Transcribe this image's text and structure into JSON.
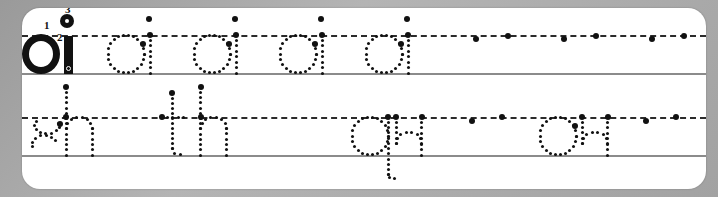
{
  "worksheet": {
    "title": "Handwriting Practice Worksheet",
    "type": "letter-tracing",
    "background_color": "#a8a8a8",
    "card_color": "#ffffff",
    "ink_color": "#111111",
    "baseline_color": "#8b8b8b",
    "midline_color": "#2b2b2b",
    "rows": [
      {
        "id": "row-1",
        "pattern": "oi",
        "model": {
          "text": "oi",
          "style": "solid",
          "stroke_numbers": [
            "1",
            "2",
            "3"
          ]
        },
        "traced": [
          {
            "text": "oi",
            "style": "dotted"
          },
          {
            "text": "oi",
            "style": "dotted"
          },
          {
            "text": "oi",
            "style": "dotted"
          },
          {
            "text": "oi",
            "style": "dotted"
          }
        ],
        "blank_practice_slots": 3
      },
      {
        "id": "row-2",
        "pattern": "sh th qu ou",
        "traced": [
          {
            "text": "sh",
            "style": "dotted"
          },
          {
            "text": "th",
            "style": "dotted"
          },
          {
            "text": "qu",
            "style": "dotted"
          },
          {
            "text": "ou",
            "style": "dotted"
          }
        ],
        "blank_practice_slots": 2
      }
    ]
  }
}
